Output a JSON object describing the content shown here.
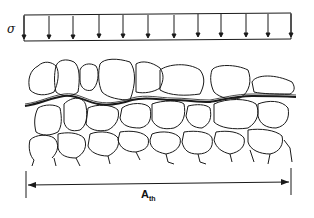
{
  "diagram": {
    "load_label": "σ",
    "dimension_label_main": "A",
    "dimension_label_sub": "th",
    "load_arrow_count": 12,
    "colors": {
      "stroke": "#1a1a1a",
      "background": "#ffffff"
    }
  }
}
